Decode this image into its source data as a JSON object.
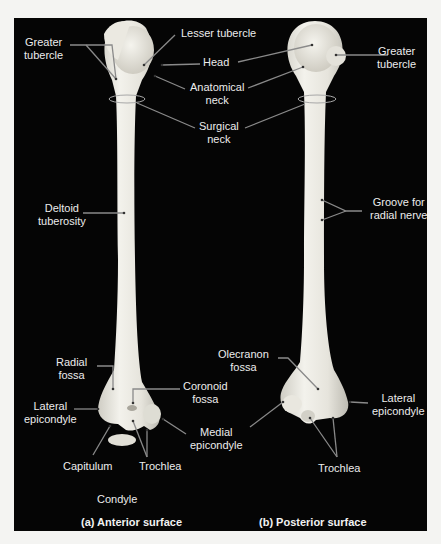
{
  "figure": {
    "colors": {
      "background": "#050505",
      "bone": "#e9e7df",
      "leader": "#8a8a8a",
      "text": "#ececec"
    }
  },
  "anterior": {
    "caption": "(a) Anterior surface",
    "labels": {
      "greater_tubercle": "Greater\ntubercle",
      "lesser_tubercle": "Lesser tubercle",
      "head": "Head",
      "anatomical_neck": "Anatomical\nneck",
      "surgical_neck": "Surgical\nneck",
      "deltoid_tuberosity": "Deltoid\ntuberosity",
      "radial_fossa": "Radial\nfossa",
      "coronoid_fossa": "Coronoid\nfossa",
      "lateral_epicondyle": "Lateral\nepicondyle",
      "medial_epicondyle": "Medial\nepicondyle",
      "capitulum": "Capitulum",
      "trochlea": "Trochlea",
      "condyle": "Condyle"
    }
  },
  "posterior": {
    "caption": "(b) Posterior surface",
    "labels": {
      "greater_tubercle": "Greater\ntubercle",
      "groove_for_radial_nerve": "Groove for\nradial nerve",
      "olecranon_fossa": "Olecranon\nfossa",
      "lateral_epicondyle": "Lateral\nepicondyle",
      "trochlea": "Trochlea"
    }
  }
}
